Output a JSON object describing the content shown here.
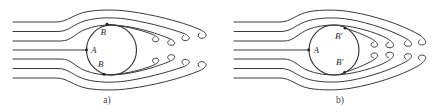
{
  "figure": {
    "background_color": "#ffffff",
    "line_color": "#3a3a3a",
    "diagram_a": {
      "caption": "a)",
      "stagnation_label": "A",
      "separation_top_label": "B",
      "separation_bottom_label": "B"
    },
    "diagram_b": {
      "caption": "b)",
      "stagnation_label": "A",
      "separation_top_label": "B′",
      "separation_bottom_label": "B′"
    }
  }
}
